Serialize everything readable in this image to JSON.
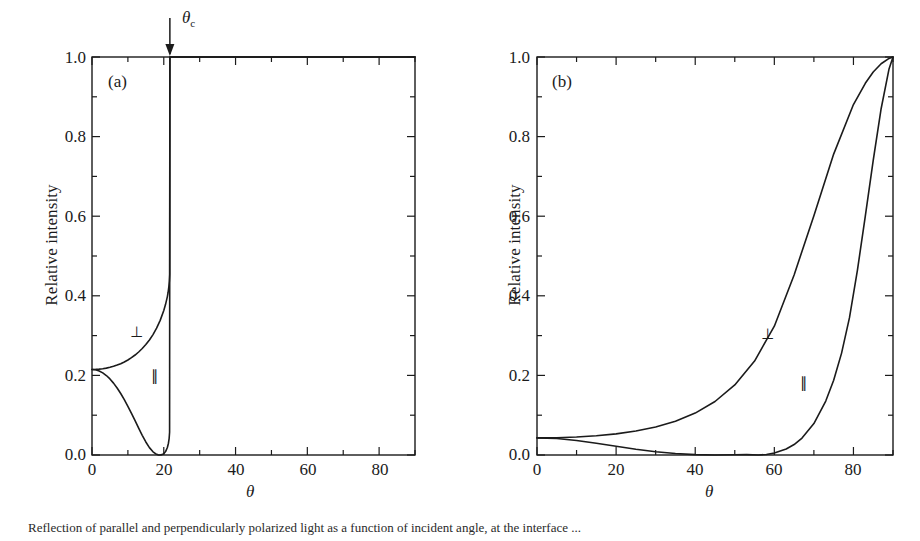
{
  "figure": {
    "caption": "Reflection of parallel and perpendicularly polarized light as a function of incident angle, at the interface ...",
    "axis_color": "#1b1b1b",
    "curve_color": "#1b1b1b",
    "background": "#ffffff"
  },
  "panels": [
    {
      "tag": "(a)",
      "xlabel": "θ",
      "ylabel": "Relative intensity",
      "xticks": [
        0,
        20,
        40,
        60,
        80
      ],
      "yticks": [
        "0.0",
        "0.2",
        "0.4",
        "0.6",
        "0.8",
        "1.0"
      ],
      "xlim": [
        0,
        90
      ],
      "ylim": [
        0,
        1
      ],
      "xminor_step": 10,
      "yminor_step": 0.1,
      "annotation": {
        "label": "θc",
        "symbol": "θ",
        "subscript": "c",
        "value": 21.7,
        "arrow": "down-arrow-icon"
      },
      "series": [
        {
          "name": "perpendicular",
          "label": "⊥",
          "label_x": 12,
          "label_y": 0.335,
          "points": [
            [
              0,
              0.215
            ],
            [
              1,
              0.2152
            ],
            [
              2,
              0.2158
            ],
            [
              3,
              0.2168
            ],
            [
              4,
              0.2183
            ],
            [
              5,
              0.2203
            ],
            [
              6,
              0.2228
            ],
            [
              7,
              0.2259
            ],
            [
              8,
              0.2295
            ],
            [
              9,
              0.2338
            ],
            [
              10,
              0.2388
            ],
            [
              11,
              0.2446
            ],
            [
              12,
              0.2512
            ],
            [
              13,
              0.2588
            ],
            [
              14,
              0.2675
            ],
            [
              15,
              0.2775
            ],
            [
              16,
              0.2891
            ],
            [
              17,
              0.3026
            ],
            [
              18,
              0.3187
            ],
            [
              19,
              0.3383
            ],
            [
              20,
              0.3632
            ],
            [
              20.5,
              0.3786
            ],
            [
              21,
              0.3981
            ],
            [
              21.2,
              0.4083
            ],
            [
              21.4,
              0.4216
            ],
            [
              21.55,
              0.4366
            ],
            [
              21.65,
              0.4536
            ],
            [
              21.7,
              1.0
            ],
            [
              22,
              1.0
            ],
            [
              30,
              1.0
            ],
            [
              45,
              1.0
            ],
            [
              60,
              1.0
            ],
            [
              75,
              1.0
            ],
            [
              90,
              1.0
            ]
          ]
        },
        {
          "name": "parallel",
          "label": "∥",
          "label_x": 15.5,
          "label_y": 0.175,
          "points": [
            [
              0,
              0.215
            ],
            [
              1,
              0.2141
            ],
            [
              2,
              0.2112
            ],
            [
              3,
              0.2064
            ],
            [
              4,
              0.1997
            ],
            [
              5,
              0.1911
            ],
            [
              6,
              0.1806
            ],
            [
              7,
              0.1684
            ],
            [
              8,
              0.1545
            ],
            [
              9,
              0.1391
            ],
            [
              10,
              0.1224
            ],
            [
              11,
              0.1046
            ],
            [
              12,
              0.0862
            ],
            [
              13,
              0.0676
            ],
            [
              14,
              0.0495
            ],
            [
              15,
              0.0327
            ],
            [
              16,
              0.0185
            ],
            [
              17,
              0.0081
            ],
            [
              17.8,
              0.0026
            ],
            [
              18.4,
              0.0004
            ],
            [
              18.9,
              0.0
            ],
            [
              19.5,
              0.0009
            ],
            [
              20,
              0.0034
            ],
            [
              20.5,
              0.0086
            ],
            [
              21,
              0.0188
            ],
            [
              21.3,
              0.0296
            ],
            [
              21.5,
              0.042
            ],
            [
              21.62,
              0.057
            ],
            [
              21.7,
              1.0
            ],
            [
              22,
              1.0
            ],
            [
              30,
              1.0
            ],
            [
              45,
              1.0
            ],
            [
              60,
              1.0
            ],
            [
              75,
              1.0
            ],
            [
              90,
              1.0
            ]
          ]
        }
      ]
    },
    {
      "tag": "(b)",
      "xlabel": "θ",
      "ylabel": "Relative intensity",
      "xticks": [
        0,
        20,
        40,
        60,
        80
      ],
      "yticks": [
        "0.0",
        "0.2",
        "0.4",
        "0.6",
        "0.8",
        "1.0"
      ],
      "xlim": [
        0,
        90
      ],
      "ylim": [
        0,
        1
      ],
      "xminor_step": 10,
      "yminor_step": 0.1,
      "series": [
        {
          "name": "perpendicular",
          "label": "⊥",
          "label_x": 62,
          "label_y": 0.29,
          "points": [
            [
              0,
              0.043
            ],
            [
              5,
              0.0435
            ],
            [
              10,
              0.0451
            ],
            [
              15,
              0.0482
            ],
            [
              20,
              0.053
            ],
            [
              25,
              0.0601
            ],
            [
              30,
              0.0703
            ],
            [
              35,
              0.0848
            ],
            [
              40,
              0.1053
            ],
            [
              45,
              0.1344
            ],
            [
              50,
              0.176
            ],
            [
              55,
              0.236
            ],
            [
              60,
              0.3236
            ],
            [
              65,
              0.4524
            ],
            [
              70,
              0.6013
            ],
            [
              75,
              0.756
            ],
            [
              80,
              0.8805
            ],
            [
              83,
              0.934
            ],
            [
              85,
              0.9622
            ],
            [
              87,
              0.983
            ],
            [
              89,
              0.9965
            ],
            [
              90,
              1.0
            ]
          ]
        },
        {
          "name": "parallel",
          "label": "∥",
          "label_x": 71,
          "label_y": 0.145,
          "points": [
            [
              0,
              0.043
            ],
            [
              5,
              0.0413
            ],
            [
              10,
              0.0365
            ],
            [
              15,
              0.0296
            ],
            [
              20,
              0.0218
            ],
            [
              25,
              0.0143
            ],
            [
              30,
              0.0081
            ],
            [
              35,
              0.0036
            ],
            [
              40,
              0.001
            ],
            [
              45,
              0.0001
            ],
            [
              50,
              0.0007
            ],
            [
              53,
              0.0009
            ],
            [
              56,
              0.0
            ],
            [
              58,
              0.0012
            ],
            [
              60,
              0.0051
            ],
            [
              63,
              0.0151
            ],
            [
              65,
              0.0262
            ],
            [
              67,
              0.0425
            ],
            [
              70,
              0.0789
            ],
            [
              73,
              0.1355
            ],
            [
              75,
              0.188
            ],
            [
              77,
              0.256
            ],
            [
              79,
              0.345
            ],
            [
              81,
              0.464
            ],
            [
              83,
              0.6
            ],
            [
              85,
              0.74
            ],
            [
              87,
              0.87
            ],
            [
              89,
              0.97
            ],
            [
              90,
              1.0
            ]
          ]
        }
      ]
    }
  ]
}
